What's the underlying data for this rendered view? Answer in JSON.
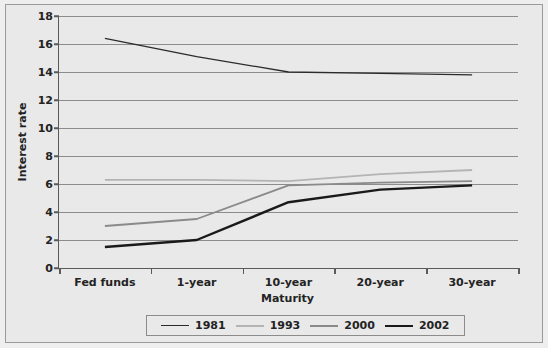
{
  "chart_data": {
    "type": "line",
    "title": "",
    "xlabel": "Maturity",
    "ylabel": "Interest rate",
    "categories": [
      "Fed funds",
      "1-year",
      "10-year",
      "20-year",
      "30-year"
    ],
    "ylim": [
      0,
      18
    ],
    "ytick_step": 2,
    "yticks": [
      "0",
      "2",
      "4",
      "6",
      "8",
      "10",
      "12",
      "14",
      "16",
      "18"
    ],
    "grid": "horizontal",
    "legend_position": "bottom",
    "series": [
      {
        "name": "1981",
        "values": [
          16.4,
          15.1,
          14.0,
          13.9,
          13.8
        ],
        "color": "#2b2b2b",
        "width": 1.3
      },
      {
        "name": "1993",
        "values": [
          6.3,
          6.3,
          6.2,
          6.7,
          7.0
        ],
        "color": "#b4b4b4",
        "width": 1.8
      },
      {
        "name": "2000",
        "values": [
          3.0,
          3.5,
          5.9,
          6.1,
          6.2
        ],
        "color": "#8a8a8a",
        "width": 1.8
      },
      {
        "name": "2002",
        "values": [
          1.5,
          2.0,
          4.7,
          5.6,
          5.9
        ],
        "color": "#1a1a1a",
        "width": 2.4
      }
    ]
  },
  "colors": {
    "background": "#e9e9e9",
    "plot_background": "#e9e9e9",
    "axis": "#5a5a5a",
    "gridline": "#8c8c8c",
    "text": "#232323"
  }
}
